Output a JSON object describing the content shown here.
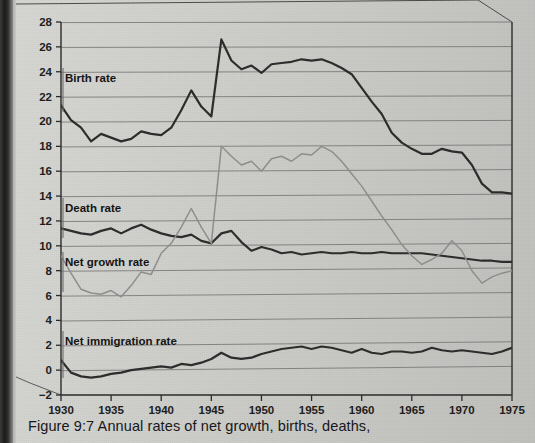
{
  "figure": {
    "caption": "Figure 9:7 Annual rates of net growth, births, deaths,"
  },
  "series_labels": {
    "birth": "Birth rate",
    "death": "Death rate",
    "net_growth": "Net growth rate",
    "net_immigration": "Net immigration rate"
  },
  "colors": {
    "dark_line": "#2b2b2b",
    "gray_line": "#8e8e8e",
    "grid": "#6e6e6e",
    "axis": "#2a2a2a",
    "paper": "#d2d2ce",
    "text": "#141414"
  },
  "chart_data": {
    "type": "line",
    "title": "Figure 9:7 Annual rates of net growth, births, deaths,",
    "xlabel": "",
    "ylabel": "",
    "xlim": [
      1930,
      1975
    ],
    "ylim": [
      -2,
      28
    ],
    "grid": true,
    "legend": "inline-labels",
    "xticks": [
      1930,
      1935,
      1940,
      1945,
      1950,
      1955,
      1960,
      1965,
      1970,
      1975
    ],
    "yticks": [
      -2,
      0,
      2,
      4,
      6,
      8,
      10,
      12,
      14,
      16,
      18,
      20,
      22,
      24,
      26,
      28
    ],
    "x": [
      1930,
      1931,
      1932,
      1933,
      1934,
      1935,
      1936,
      1937,
      1938,
      1939,
      1940,
      1941,
      1942,
      1943,
      1944,
      1945,
      1946,
      1947,
      1948,
      1949,
      1950,
      1951,
      1952,
      1953,
      1954,
      1955,
      1956,
      1957,
      1958,
      1959,
      1960,
      1961,
      1962,
      1963,
      1964,
      1965,
      1966,
      1967,
      1968,
      1969,
      1970,
      1971,
      1972,
      1973,
      1974,
      1975
    ],
    "series": [
      {
        "name": "Birth rate",
        "color": "#2b2b2b",
        "values": [
          21.3,
          20.1,
          19.5,
          18.4,
          19.0,
          18.7,
          18.4,
          18.6,
          19.2,
          19.0,
          18.9,
          19.5,
          20.9,
          22.5,
          21.2,
          20.4,
          26.6,
          24.9,
          24.2,
          24.5,
          23.9,
          24.6,
          24.7,
          24.8,
          25.0,
          24.9,
          25.0,
          24.7,
          24.3,
          23.8,
          22.7,
          21.6,
          20.6,
          19.1,
          18.3,
          17.8,
          17.4,
          17.4,
          17.8,
          17.6,
          17.5,
          16.5,
          15.0,
          14.3,
          14.3,
          14.2
        ]
      },
      {
        "name": "Death rate",
        "color": "#2b2b2b",
        "values": [
          11.4,
          11.2,
          11.0,
          10.9,
          11.2,
          11.4,
          11.0,
          11.4,
          11.7,
          11.3,
          11.0,
          10.8,
          10.7,
          10.9,
          10.4,
          10.2,
          11.0,
          11.2,
          10.3,
          9.6,
          9.9,
          9.7,
          9.4,
          9.5,
          9.3,
          9.4,
          9.5,
          9.4,
          9.4,
          9.5,
          9.4,
          9.4,
          9.5,
          9.4,
          9.4,
          9.4,
          9.4,
          9.3,
          9.2,
          9.1,
          9.0,
          8.9,
          8.8,
          8.8,
          8.7,
          8.7
        ]
      },
      {
        "name": "Net growth rate",
        "color": "#8e8e8e",
        "values": [
          9.2,
          7.8,
          6.5,
          6.2,
          6.1,
          6.4,
          5.9,
          6.8,
          7.9,
          7.7,
          9.4,
          10.2,
          11.5,
          13.0,
          11.5,
          10.2,
          18.0,
          17.2,
          16.5,
          16.8,
          16.0,
          17.0,
          17.2,
          16.8,
          17.4,
          17.3,
          18.0,
          17.6,
          16.8,
          15.8,
          14.8,
          13.6,
          12.4,
          11.3,
          10.1,
          9.2,
          8.5,
          8.9,
          9.4,
          10.4,
          9.6,
          8.0,
          7.0,
          7.5,
          7.8,
          8.0
        ]
      },
      {
        "name": "Net immigration rate",
        "color": "#2b2b2b",
        "values": [
          0.8,
          -0.2,
          -0.5,
          -0.6,
          -0.5,
          -0.3,
          -0.2,
          0.0,
          0.1,
          0.2,
          0.3,
          0.2,
          0.5,
          0.4,
          0.6,
          0.9,
          1.4,
          1.0,
          0.9,
          1.0,
          1.3,
          1.5,
          1.7,
          1.8,
          1.9,
          1.7,
          1.9,
          1.8,
          1.6,
          1.4,
          1.7,
          1.4,
          1.3,
          1.5,
          1.5,
          1.4,
          1.5,
          1.8,
          1.6,
          1.5,
          1.6,
          1.5,
          1.4,
          1.3,
          1.5,
          1.8
        ]
      }
    ]
  },
  "label_anchors": {
    "birth": {
      "x": 65,
      "y": 82,
      "leader_x": 63,
      "leader_y_top": 68,
      "leader_y_bottom": 112
    },
    "death": {
      "x": 65,
      "y": 212,
      "leader_x": 63,
      "leader_y_top": 198,
      "leader_y_bottom": 238
    },
    "net_growth": {
      "x": 65,
      "y": 266,
      "leader_x": 63,
      "leader_y_top": 252,
      "leader_y_bottom": 292
    },
    "net_immigration": {
      "x": 65,
      "y": 345,
      "leader_x": 63,
      "leader_y_top": 331,
      "leader_y_bottom": 378
    }
  }
}
